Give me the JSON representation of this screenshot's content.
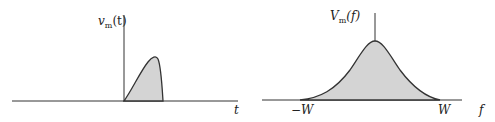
{
  "time_plot": {
    "y_label": "v",
    "y_label_sub": "m",
    "y_label_arg": "(t)",
    "x_label": "t",
    "description": "Time-limited pulse starting at t=0"
  },
  "freq_plot": {
    "y_label": "V",
    "y_label_sub": "m",
    "y_label_arg": "(f)",
    "x_label": "f",
    "tick_neg": "−W",
    "tick_pos": "W",
    "description": "Bandlimited spectrum between -W and W"
  },
  "colors": {
    "fill": "#d4d4d4",
    "stroke": "#333333",
    "axis": "#333333"
  }
}
